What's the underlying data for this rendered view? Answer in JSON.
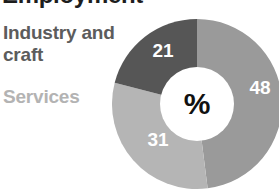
{
  "title": {
    "text": "Employment",
    "note_visible": "only the bottom edge of the heading is visible at the top of the crop"
  },
  "legend": {
    "items": [
      {
        "label": "Industry and craft",
        "color": "#5c5c5c"
      },
      {
        "label": "Services",
        "color": "#b3b3b3"
      }
    ]
  },
  "center": {
    "symbol": "%"
  },
  "chart_data": {
    "type": "pie",
    "variant": "donut",
    "title": "Employment",
    "unit": "%",
    "center_label": "%",
    "categories": [
      "Services",
      "Industry and craft",
      "Agriculture"
    ],
    "values": [
      48,
      31,
      21
    ],
    "slices": [
      {
        "label": "48",
        "value": 48,
        "category": "Services",
        "color": "#9a9a9a",
        "start_angle_deg": 0,
        "end_angle_deg": 172.8,
        "label_x": 148,
        "label_y": 71
      },
      {
        "label": "31",
        "value": 31,
        "category": "Industry and craft",
        "color": "#b5b5b5",
        "start_angle_deg": 172.8,
        "end_angle_deg": 284.4,
        "label_x": 46,
        "label_y": 123
      },
      {
        "label": "21",
        "value": 21,
        "category": "Agriculture",
        "color": "#565656",
        "start_angle_deg": 284.4,
        "end_angle_deg": 360,
        "label_x": 51,
        "label_y": 34
      }
    ],
    "total": 100,
    "legend_position": "left",
    "grid": false,
    "xlabel": "",
    "ylabel": ""
  },
  "geometry": {
    "cx": 85,
    "cy": 86,
    "outer_radius": 85,
    "inner_radius": 37
  }
}
